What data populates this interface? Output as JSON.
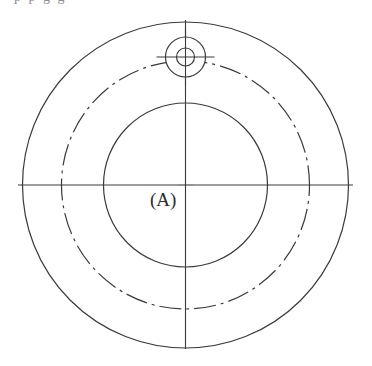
{
  "figure": {
    "label": "(A)",
    "clipped_header_text": "p        p        g        g",
    "canvas": {
      "width": 372,
      "height": 366,
      "background": "#ffffff"
    },
    "colors": {
      "line": "#3a3a3a",
      "line_light": "#4a4a4a",
      "background": "#ffffff",
      "label_text": "#2e2e2e",
      "clipped_text": "#8b8b92"
    },
    "center": {
      "x": 185.5,
      "y": 185
    },
    "circles": [
      {
        "name": "outer-circle",
        "style": "solid",
        "radius": 163,
        "cx": 185.5,
        "cy": 185,
        "stroke_width": 1.2
      },
      {
        "name": "bolt-circle",
        "style": "dash-dot",
        "radius": 124,
        "cx": 185.5,
        "cy": 185,
        "stroke_width": 1.2
      },
      {
        "name": "inner-circle",
        "style": "solid",
        "radius": 82,
        "cx": 185.5,
        "cy": 185,
        "stroke_width": 1.2
      }
    ],
    "hole": {
      "name": "small-hole",
      "cx": 185.5,
      "cy": 57,
      "outer_radius": 20,
      "inner_radius": 9,
      "crosshair_half_length": 29
    },
    "centerlines": {
      "horizontal": {
        "x1": 18,
        "x2": 353,
        "y": 185
      },
      "vertical": {
        "y1": 20,
        "y2": 349,
        "x": 185.5
      },
      "center_gap": 7
    },
    "label_position": {
      "x": 150,
      "y": 206
    }
  }
}
